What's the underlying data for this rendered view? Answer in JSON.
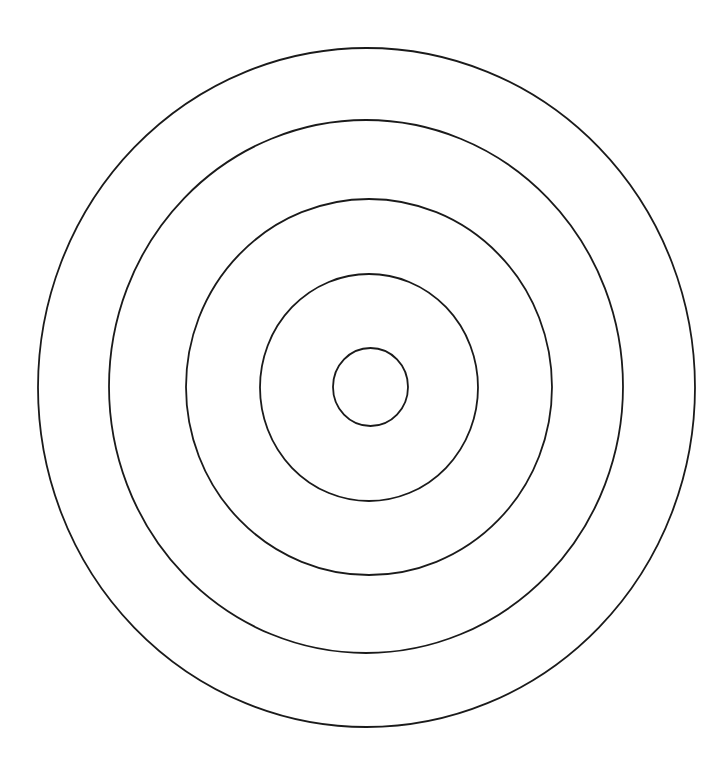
{
  "diagram": {
    "type": "concentric-circles",
    "background": "#ffffff",
    "stroke_color": "#1a1a1a",
    "stroke_width": 1.8,
    "center": {
      "x": 368,
      "y": 387
    },
    "rings": [
      {
        "name": "ring-1-outer",
        "cx": 366.5,
        "cy": 387.5,
        "rx": 328.5,
        "ry": 339.5
      },
      {
        "name": "ring-2",
        "cx": 366,
        "cy": 386.5,
        "rx": 257,
        "ry": 266.5
      },
      {
        "name": "ring-3",
        "cx": 369,
        "cy": 387,
        "rx": 183,
        "ry": 188
      },
      {
        "name": "ring-4",
        "cx": 369,
        "cy": 387.5,
        "rx": 109,
        "ry": 113.5
      },
      {
        "name": "ring-5-inner",
        "cx": 370.5,
        "cy": 387,
        "rx": 37.5,
        "ry": 39
      }
    ]
  }
}
